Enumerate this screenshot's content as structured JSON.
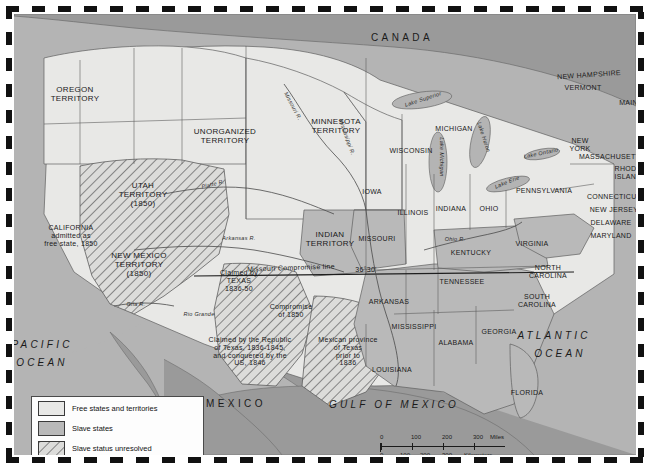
{
  "map": {
    "title": "United States 1850 - Free and Slave States and Territories",
    "colors": {
      "free": "#e8e8e6",
      "slave": "#b9b9b9",
      "unresolved": "#d7d7d5",
      "water": "#b4b4b4",
      "foreign": "#9a9a9a",
      "border": "#3a3a3a"
    }
  },
  "legend": {
    "items": [
      {
        "label": "Free states and territories",
        "swatch": "free"
      },
      {
        "label": "Slave states",
        "swatch": "slave"
      },
      {
        "label": "Slave status unresolved",
        "swatch": "unresolved"
      }
    ]
  },
  "scale": {
    "miles_label": "Miles",
    "km_label": "Kilometers",
    "miles_ticks": [
      "0",
      "100",
      "200",
      "300"
    ],
    "km_ticks": [
      "0",
      "100",
      "200",
      "300"
    ]
  },
  "countries": [
    {
      "name": "CANADA",
      "x": 388,
      "y": 24
    },
    {
      "name": "MEXICO",
      "x": 222,
      "y": 390
    }
  ],
  "oceans": [
    {
      "name": "PACIFIC",
      "x": 28,
      "y": 331
    },
    {
      "name": "OCEAN",
      "x": 28,
      "y": 349
    },
    {
      "name": "ATLANTIC",
      "x": 540,
      "y": 322
    },
    {
      "name": "OCEAN",
      "x": 546,
      "y": 340
    },
    {
      "name": "GULF OF MEXICO",
      "x": 380,
      "y": 391
    }
  ],
  "territories": [
    {
      "name": "OREGON\nTERRITORY",
      "x": 61,
      "y": 81
    },
    {
      "name": "UNORGANIZED\nTERRITORY",
      "x": 211,
      "y": 123
    },
    {
      "name": "MINNESOTA\nTERRITORY",
      "x": 322,
      "y": 113
    },
    {
      "name": "UTAH\nTERRITORY\n(1850)",
      "x": 129,
      "y": 181
    },
    {
      "name": "NEW MEXICO\nTERRITORY\n(1850)",
      "x": 125,
      "y": 251
    },
    {
      "name": "INDIAN\nTERRITORY",
      "x": 316,
      "y": 226
    }
  ],
  "states": [
    {
      "name": "IOWA",
      "x": 358,
      "y": 178
    },
    {
      "name": "WISCONSIN",
      "x": 397,
      "y": 137
    },
    {
      "name": "MICHIGAN",
      "x": 440,
      "y": 115
    },
    {
      "name": "ILLINOIS",
      "x": 399,
      "y": 199
    },
    {
      "name": "INDIANA",
      "x": 437,
      "y": 195
    },
    {
      "name": "OHIO",
      "x": 475,
      "y": 195
    },
    {
      "name": "MISSOURI",
      "x": 363,
      "y": 225
    },
    {
      "name": "KENTUCKY",
      "x": 457,
      "y": 239
    },
    {
      "name": "TENNESSEE",
      "x": 448,
      "y": 268
    },
    {
      "name": "ARKANSAS",
      "x": 375,
      "y": 288
    },
    {
      "name": "MISSISSIPPI",
      "x": 400,
      "y": 313
    },
    {
      "name": "ALABAMA",
      "x": 442,
      "y": 329
    },
    {
      "name": "GEORGIA",
      "x": 485,
      "y": 318
    },
    {
      "name": "LOUISIANA",
      "x": 378,
      "y": 356
    },
    {
      "name": "FLORIDA",
      "x": 513,
      "y": 379
    },
    {
      "name": "PENNSYLVANIA",
      "x": 530,
      "y": 177
    },
    {
      "name": "VIRGINIA",
      "x": 518,
      "y": 230
    },
    {
      "name": "NORTH\nCAROLINA",
      "x": 534,
      "y": 258
    },
    {
      "name": "SOUTH\nCAROLINA",
      "x": 523,
      "y": 287
    },
    {
      "name": "NEW\nYORK",
      "x": 566,
      "y": 131
    },
    {
      "name": "MASSACHUSETTS",
      "x": 598,
      "y": 143
    },
    {
      "name": "MAINE",
      "x": 617,
      "y": 89
    },
    {
      "name": "NEW HAMPSHIRE",
      "x": 575,
      "y": 61
    },
    {
      "name": "VERMONT",
      "x": 569,
      "y": 74
    },
    {
      "name": "RHODE\nISLAND",
      "x": 614,
      "y": 159
    },
    {
      "name": "CONNECTICUT",
      "x": 600,
      "y": 183
    },
    {
      "name": "NEW JERSEY",
      "x": 600,
      "y": 196
    },
    {
      "name": "DELAWARE",
      "x": 597,
      "y": 209
    },
    {
      "name": "MARYLAND",
      "x": 597,
      "y": 222
    }
  ],
  "annotations": [
    {
      "text": "CALIFORNIA\nadmitted as\nfree state, 1850",
      "x": 57,
      "y": 222
    },
    {
      "text": "Claimed by\nTEXAS\n1836-50",
      "x": 225,
      "y": 267
    },
    {
      "text": "Claimed by the Republic\nof Texas, 1836-1845,\nand conquered by the\nUS, 1846",
      "x": 236,
      "y": 338
    },
    {
      "text": "Mexican province\nof Texas\nprior to\n1836",
      "x": 334,
      "y": 338
    },
    {
      "text": "Compromise\nof 1850",
      "x": 277,
      "y": 297
    },
    {
      "text": "Missouri Compromise line",
      "x": 277,
      "y": 254
    },
    {
      "text": "36°30'",
      "x": 352,
      "y": 256
    }
  ],
  "rivers": [
    {
      "name": "Missouri R.",
      "x": 279,
      "y": 92
    },
    {
      "name": "Platte R.",
      "x": 199,
      "y": 170
    },
    {
      "name": "Mississippi R.",
      "x": 333,
      "y": 123
    },
    {
      "name": "Arkansas R.",
      "x": 225,
      "y": 224
    },
    {
      "name": "Ohio R.",
      "x": 441,
      "y": 225
    },
    {
      "name": "Gila R.",
      "x": 122,
      "y": 290
    },
    {
      "name": "Rio Grande",
      "x": 185,
      "y": 300
    }
  ],
  "lakes": [
    {
      "name": "Lake Superior",
      "x": 409,
      "y": 85
    },
    {
      "name": "Lake Michigan",
      "x": 428,
      "y": 143
    },
    {
      "name": "Lake Huron",
      "x": 470,
      "y": 123
    },
    {
      "name": "Lake Erie",
      "x": 493,
      "y": 168
    },
    {
      "name": "Lake Ontario",
      "x": 527,
      "y": 139
    }
  ]
}
